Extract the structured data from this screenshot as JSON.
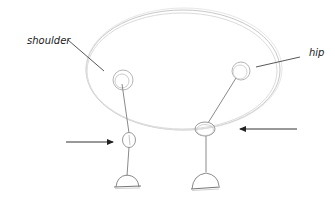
{
  "diagram": {
    "type": "sketch",
    "labels": {
      "shoulder": "shoulder",
      "hip": "hip"
    },
    "components": {
      "body": "ellipse",
      "front_leg": [
        "shoulder",
        "knee",
        "foot"
      ],
      "hind_leg": [
        "hip",
        "knee",
        "foot"
      ],
      "arrows": [
        {
          "direction": "right",
          "points_to": "front-leg-knee"
        },
        {
          "direction": "left",
          "points_to": "hind-leg-knee"
        }
      ]
    },
    "colors": {
      "pencil": "#9a9a9a",
      "pencil_light": "#c8c8c8",
      "ink": "#222222",
      "label": "#1a1a1a"
    }
  }
}
